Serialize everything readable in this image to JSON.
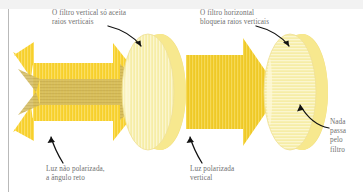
{
  "figure": {
    "background_color": "#ffffff",
    "top_band_color": "#f2f2f2",
    "rule_color": "#b9b9b9",
    "text_color": "#6f6f6f",
    "arrow_color": "#111111",
    "colors": {
      "beam_bright": "#F7D02B",
      "beam_bright_stripe": "#FBDE63",
      "beam_cross": "#D6BE63",
      "beam_cross_stripe": "#C9AF52",
      "filter_pale": "#F6EDA6",
      "filter_pale_stripe": "#FAF4C8",
      "filter_edge": "#F2DE7C",
      "filter_rim": "#EFD25B"
    }
  },
  "labels": {
    "vertical_filter": "O filtro vertical só aceita\nraios verticais",
    "horizontal_filter": "O filtro horizontal\nbloqueia raios verticais",
    "unpolarized_light": "Luz não polarizada,\na ângulo reto",
    "polarized_light": "Luz polarizada\nvertical",
    "nothing_passes": "Nada\npassa\npelo\nfiltro"
  },
  "elements": {
    "unpolarized_beam_vertical": "vertically-striped-arrow",
    "unpolarized_beam_horizontal": "horizontally-striped-arrow",
    "first_filter": "vertical-polarizing-filter-disc",
    "polarized_beam": "vertically-striped-arrow",
    "second_filter": "horizontal-polarizing-filter-disc"
  }
}
